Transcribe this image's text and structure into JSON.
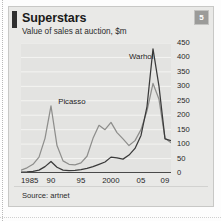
{
  "card": {
    "title": "Superstars",
    "subtitle": "Value of sales at auction, $m",
    "badge": "5",
    "source": "Source: artnet",
    "ghost_text": ""
  },
  "colors": {
    "card_bg": "#e9e9e7",
    "plot_bg": "#e3e3e1",
    "picasso_line": "#8e8e8c",
    "warhol_line": "#3a3a3a",
    "axis": "#4a4a4a",
    "grid": "#f4f4f2",
    "badge_bg": "#9b9b99",
    "title_bar": "#2f2f2f"
  },
  "chart_data": {
    "type": "line",
    "title": "Superstars",
    "subtitle": "Value of sales at auction, $m",
    "xlabel": "",
    "ylabel": "$m",
    "ylim": [
      0,
      450
    ],
    "yticks": [
      0,
      50,
      100,
      150,
      200,
      250,
      300,
      350,
      400,
      450
    ],
    "xlim": [
      1985,
      2010
    ],
    "xticks": [
      1985,
      1990,
      1995,
      2000,
      2005,
      2009
    ],
    "xticklabels": [
      "1985",
      "90",
      "95",
      "2000",
      "05",
      "09"
    ],
    "grid": true,
    "legend": "inline-annotations",
    "annotations": [
      {
        "text": "Picasso",
        "x": 1991.2,
        "y": 245
      },
      {
        "text": "Warhol",
        "x": 2003.0,
        "y": 400
      }
    ],
    "x": [
      1985,
      1986,
      1987,
      1988,
      1989,
      1990,
      1991,
      1992,
      1993,
      1994,
      1995,
      1996,
      1997,
      1998,
      1999,
      2000,
      2001,
      2002,
      2003,
      2004,
      2005,
      2006,
      2007,
      2008,
      2009,
      2010
    ],
    "series": [
      {
        "name": "Picasso",
        "color": "#8e8e8c",
        "values": [
          10,
          18,
          30,
          55,
          120,
          232,
          95,
          42,
          30,
          28,
          35,
          58,
          120,
          165,
          150,
          175,
          140,
          118,
          95,
          112,
          150,
          215,
          310,
          255,
          120,
          105
        ]
      },
      {
        "name": "Warhol",
        "color": "#3a3a3a",
        "values": [
          3,
          4,
          6,
          10,
          22,
          40,
          20,
          10,
          8,
          9,
          12,
          16,
          22,
          30,
          38,
          55,
          52,
          48,
          62,
          85,
          130,
          230,
          430,
          300,
          118,
          112
        ]
      }
    ]
  }
}
